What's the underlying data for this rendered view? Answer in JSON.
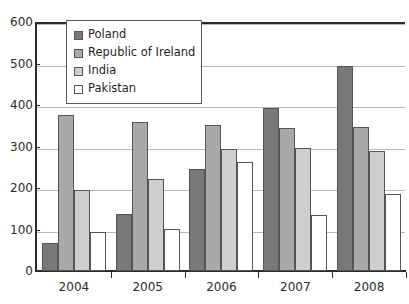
{
  "chart_data": {
    "type": "bar",
    "title": "",
    "xlabel": "",
    "ylabel": "",
    "categories": [
      "2004",
      "2005",
      "2006",
      "2007",
      "2008"
    ],
    "ylim": [
      0,
      600
    ],
    "yticks": [
      0,
      100,
      200,
      300,
      400,
      500,
      600
    ],
    "grid": true,
    "legend_position": "top-left-inside",
    "series": [
      {
        "name": "Poland",
        "color": "#787878",
        "values": [
          68,
          137,
          245,
          393,
          493
        ]
      },
      {
        "name": "Republic of Ireland",
        "color": "#a9a9a9",
        "values": [
          375,
          358,
          352,
          345,
          346
        ]
      },
      {
        "name": "India",
        "color": "#cfcfcf",
        "values": [
          196,
          222,
          295,
          296,
          288
        ]
      },
      {
        "name": "Pakistan",
        "color": "#ffffff",
        "values": [
          93,
          102,
          262,
          135,
          185
        ]
      }
    ]
  },
  "axis": {
    "y_tick_labels": [
      "0",
      "100",
      "200",
      "300",
      "400",
      "500",
      "600"
    ],
    "x_tick_labels": [
      "2004",
      "2005",
      "2006",
      "2007",
      "2008"
    ]
  },
  "legend": {
    "entries": [
      {
        "label": "Poland"
      },
      {
        "label": "Republic of Ireland"
      },
      {
        "label": "India"
      },
      {
        "label": "Pakistan"
      }
    ]
  }
}
